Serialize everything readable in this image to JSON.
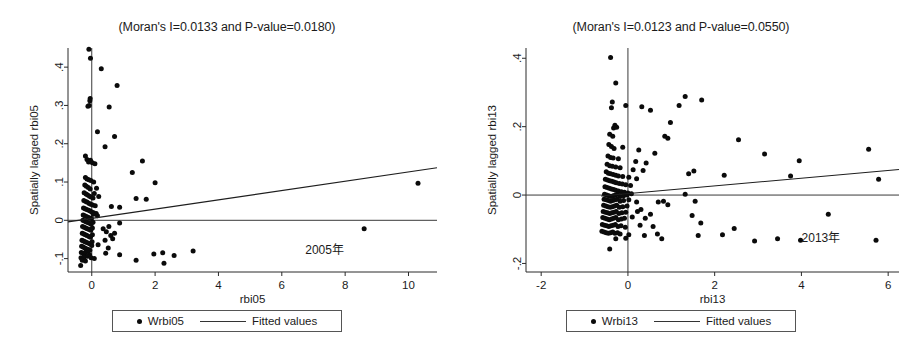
{
  "figure": {
    "width": 908,
    "height": 350,
    "background": "#ffffff",
    "ink_color": "#0b0b0b"
  },
  "chart_data": [
    {
      "id": "moran-2005",
      "type": "scatter",
      "title": "(Moran's I=0.0133 and P-value=0.0180)",
      "xlabel": "rbi05",
      "ylabel": "Spatially lagged rbi05",
      "annotation": "2005年",
      "morans_i": 0.0133,
      "p_value": 0.018,
      "xlim": [
        -0.75,
        10.9
      ],
      "ylim": [
        -0.135,
        0.45
      ],
      "xticks": [
        0,
        2,
        4,
        6,
        8,
        10
      ],
      "xtick_labels": [
        "0",
        "2",
        "4",
        "6",
        "8",
        "10"
      ],
      "yticks": [
        -0.1,
        0,
        0.1,
        0.2,
        0.3,
        0.4
      ],
      "ytick_labels": [
        "-.1",
        "0",
        ".1",
        ".2",
        ".3",
        ".4"
      ],
      "grid": false,
      "legend": {
        "position": "below",
        "entries": [
          {
            "label": "Wrbi05",
            "marker": "dot"
          },
          {
            "label": "Fitted values",
            "marker": "line"
          }
        ]
      },
      "fit_line": {
        "x0": -0.75,
        "y0": -0.0042,
        "x1": 10.9,
        "y1": 0.1372
      },
      "reference_lines": {
        "vertical_x": 0.0,
        "horizontal_y": 0.0
      },
      "points": [
        [
          -0.09,
          0.447
        ],
        [
          -0.04,
          0.423
        ],
        [
          0.3,
          0.396
        ],
        [
          0.8,
          0.352
        ],
        [
          -0.05,
          0.318
        ],
        [
          -0.06,
          0.312
        ],
        [
          -0.08,
          0.3
        ],
        [
          -0.12,
          0.298
        ],
        [
          0.55,
          0.296
        ],
        [
          0.18,
          0.231
        ],
        [
          0.72,
          0.219
        ],
        [
          0.42,
          0.192
        ],
        [
          -0.2,
          0.168
        ],
        [
          -0.15,
          0.159
        ],
        [
          -0.04,
          0.157
        ],
        [
          -0.1,
          0.152
        ],
        [
          0.02,
          0.15
        ],
        [
          0.1,
          0.148
        ],
        [
          1.6,
          0.155
        ],
        [
          1.28,
          0.125
        ],
        [
          -0.2,
          0.112
        ],
        [
          -0.15,
          0.108
        ],
        [
          -0.09,
          0.106
        ],
        [
          -0.03,
          0.104
        ],
        [
          0.06,
          0.1
        ],
        [
          2.0,
          0.098
        ],
        [
          10.3,
          0.097
        ],
        [
          -0.22,
          0.092
        ],
        [
          -0.17,
          0.089
        ],
        [
          -0.11,
          0.086
        ],
        [
          -0.05,
          0.082
        ],
        [
          0.15,
          0.084
        ],
        [
          0.08,
          0.07
        ],
        [
          -0.24,
          0.072
        ],
        [
          -0.18,
          0.069
        ],
        [
          -0.13,
          0.066
        ],
        [
          -0.07,
          0.063
        ],
        [
          -0.02,
          0.061
        ],
        [
          0.04,
          0.058
        ],
        [
          1.4,
          0.057
        ],
        [
          1.72,
          0.055
        ],
        [
          0.22,
          0.062
        ],
        [
          -0.25,
          0.052
        ],
        [
          -0.19,
          0.049
        ],
        [
          -0.14,
          0.047
        ],
        [
          -0.08,
          0.044
        ],
        [
          -0.03,
          0.042
        ],
        [
          0.03,
          0.04
        ],
        [
          0.11,
          0.038
        ],
        [
          0.62,
          0.036
        ],
        [
          0.88,
          0.034
        ],
        [
          -0.26,
          0.032
        ],
        [
          -0.21,
          0.03
        ],
        [
          -0.16,
          0.028
        ],
        [
          -0.1,
          0.026
        ],
        [
          -0.05,
          0.024
        ],
        [
          0.0,
          0.022
        ],
        [
          0.06,
          0.02
        ],
        [
          0.14,
          0.018
        ],
        [
          -0.27,
          0.014
        ],
        [
          -0.22,
          0.012
        ],
        [
          -0.17,
          0.01
        ],
        [
          -0.12,
          0.008
        ],
        [
          -0.06,
          0.006
        ],
        [
          -0.01,
          0.005
        ],
        [
          0.05,
          0.016
        ],
        [
          0.18,
          0.012
        ],
        [
          -0.28,
          0.0
        ],
        [
          -0.23,
          -0.002
        ],
        [
          -0.18,
          -0.004
        ],
        [
          -0.13,
          -0.006
        ],
        [
          -0.07,
          -0.008
        ],
        [
          -0.02,
          -0.01
        ],
        [
          0.04,
          -0.005
        ],
        [
          0.88,
          -0.007
        ],
        [
          -0.29,
          -0.016
        ],
        [
          -0.24,
          -0.018
        ],
        [
          -0.19,
          -0.02
        ],
        [
          -0.14,
          -0.022
        ],
        [
          -0.08,
          -0.024
        ],
        [
          -0.03,
          -0.026
        ],
        [
          0.02,
          -0.02
        ],
        [
          0.36,
          -0.022
        ],
        [
          0.46,
          -0.03
        ],
        [
          0.54,
          -0.016
        ],
        [
          8.6,
          -0.022
        ],
        [
          -0.3,
          -0.034
        ],
        [
          -0.25,
          -0.036
        ],
        [
          -0.2,
          -0.038
        ],
        [
          -0.15,
          -0.04
        ],
        [
          -0.09,
          -0.042
        ],
        [
          -0.04,
          -0.044
        ],
        [
          0.02,
          -0.038
        ],
        [
          0.6,
          -0.04
        ],
        [
          0.66,
          -0.048
        ],
        [
          0.72,
          -0.034
        ],
        [
          -0.31,
          -0.052
        ],
        [
          -0.26,
          -0.054
        ],
        [
          -0.21,
          -0.056
        ],
        [
          -0.16,
          -0.058
        ],
        [
          -0.1,
          -0.06
        ],
        [
          -0.05,
          -0.062
        ],
        [
          0.01,
          -0.056
        ],
        [
          0.42,
          -0.052
        ],
        [
          -0.32,
          -0.068
        ],
        [
          -0.27,
          -0.07
        ],
        [
          -0.22,
          -0.072
        ],
        [
          -0.17,
          -0.074
        ],
        [
          -0.11,
          -0.076
        ],
        [
          -0.06,
          -0.078
        ],
        [
          0.0,
          -0.066
        ],
        [
          0.2,
          -0.064
        ],
        [
          0.52,
          -0.072
        ],
        [
          -0.33,
          -0.084
        ],
        [
          -0.28,
          -0.086
        ],
        [
          -0.23,
          -0.088
        ],
        [
          -0.18,
          -0.082
        ],
        [
          -0.12,
          -0.08
        ],
        [
          -0.07,
          -0.09
        ],
        [
          0.44,
          -0.086
        ],
        [
          0.88,
          -0.09
        ],
        [
          1.96,
          -0.088
        ],
        [
          2.24,
          -0.085
        ],
        [
          2.6,
          -0.092
        ],
        [
          3.2,
          -0.08
        ],
        [
          -0.34,
          -0.098
        ],
        [
          -0.29,
          -0.1
        ],
        [
          -0.24,
          -0.096
        ],
        [
          -0.13,
          -0.094
        ],
        [
          -0.02,
          -0.098
        ],
        [
          0.08,
          -0.1
        ],
        [
          -0.3,
          -0.104
        ],
        [
          -0.2,
          -0.106
        ],
        [
          1.4,
          -0.104
        ],
        [
          2.28,
          -0.112
        ],
        [
          -0.35,
          -0.118
        ]
      ]
    },
    {
      "id": "moran-2013",
      "type": "scatter",
      "title": "(Moran's I=0.0123 and P-value=0.0550)",
      "xlabel": "rbi13",
      "ylabel": "Spatially lagged rbi13",
      "annotation": "2013年",
      "morans_i": 0.0123,
      "p_value": 0.055,
      "xlim": [
        -2.35,
        6.25
      ],
      "ylim": [
        -0.225,
        0.43
      ],
      "xticks": [
        -2,
        0,
        2,
        4,
        6
      ],
      "xtick_labels": [
        "-2",
        "0",
        "2",
        "4",
        "6"
      ],
      "yticks": [
        -0.2,
        0,
        0.2,
        0.4
      ],
      "ytick_labels": [
        "-.2",
        "0",
        ".2",
        ".4"
      ],
      "grid": false,
      "legend": {
        "position": "below",
        "entries": [
          {
            "label": "Wrbi13",
            "marker": "dot"
          },
          {
            "label": "Fitted values",
            "marker": "line"
          }
        ]
      },
      "fit_line": {
        "x0": -0.62,
        "y0": -0.0028,
        "x1": 6.25,
        "y1": 0.0745
      },
      "reference_lines": {
        "vertical_x": 0.0,
        "horizontal_y": 0.0
      },
      "points": [
        [
          -0.4,
          0.402
        ],
        [
          -0.28,
          0.328
        ],
        [
          -0.36,
          0.272
        ],
        [
          -0.05,
          0.262
        ],
        [
          -0.38,
          0.255
        ],
        [
          0.32,
          0.258
        ],
        [
          0.52,
          0.248
        ],
        [
          1.32,
          0.288
        ],
        [
          1.7,
          0.278
        ],
        [
          1.18,
          0.262
        ],
        [
          0.98,
          0.212
        ],
        [
          -0.33,
          0.196
        ],
        [
          -0.3,
          0.204
        ],
        [
          -0.26,
          0.198
        ],
        [
          -0.42,
          0.178
        ],
        [
          -0.35,
          0.172
        ],
        [
          0.85,
          0.172
        ],
        [
          0.92,
          0.166
        ],
        [
          2.55,
          0.162
        ],
        [
          5.55,
          0.134
        ],
        [
          3.15,
          0.12
        ],
        [
          3.95,
          0.1
        ],
        [
          -0.44,
          0.148
        ],
        [
          -0.38,
          0.142
        ],
        [
          -0.32,
          0.136
        ],
        [
          -0.12,
          0.14
        ],
        [
          0.25,
          0.132
        ],
        [
          0.62,
          0.122
        ],
        [
          -0.46,
          0.114
        ],
        [
          -0.4,
          0.11
        ],
        [
          -0.34,
          0.108
        ],
        [
          -0.22,
          0.106
        ],
        [
          0.18,
          0.098
        ],
        [
          0.42,
          0.094
        ],
        [
          -0.48,
          0.09
        ],
        [
          -0.42,
          0.086
        ],
        [
          -0.36,
          0.084
        ],
        [
          -0.28,
          0.082
        ],
        [
          -0.18,
          0.08
        ],
        [
          0.12,
          0.074
        ],
        [
          0.35,
          0.072
        ],
        [
          1.52,
          0.07
        ],
        [
          2.22,
          0.058
        ],
        [
          3.75,
          0.056
        ],
        [
          5.78,
          0.046
        ],
        [
          -0.5,
          0.068
        ],
        [
          -0.45,
          0.064
        ],
        [
          -0.4,
          0.062
        ],
        [
          -0.34,
          0.06
        ],
        [
          -0.28,
          0.058
        ],
        [
          -0.22,
          0.056
        ],
        [
          -0.12,
          0.054
        ],
        [
          0.02,
          0.052
        ],
        [
          0.2,
          0.048
        ],
        [
          1.4,
          0.062
        ],
        [
          -0.52,
          0.046
        ],
        [
          -0.47,
          0.044
        ],
        [
          -0.42,
          0.042
        ],
        [
          -0.37,
          0.04
        ],
        [
          -0.32,
          0.038
        ],
        [
          -0.27,
          0.036
        ],
        [
          -0.2,
          0.034
        ],
        [
          -0.13,
          0.032
        ],
        [
          -0.05,
          0.03
        ],
        [
          0.06,
          0.028
        ],
        [
          -0.53,
          0.024
        ],
        [
          -0.48,
          0.022
        ],
        [
          -0.43,
          0.02
        ],
        [
          -0.38,
          0.018
        ],
        [
          -0.33,
          0.016
        ],
        [
          -0.28,
          0.014
        ],
        [
          -0.22,
          0.012
        ],
        [
          -0.15,
          0.01
        ],
        [
          -0.08,
          0.008
        ],
        [
          0.0,
          0.006
        ],
        [
          0.08,
          0.004
        ],
        [
          -0.54,
          0.002
        ],
        [
          -0.49,
          0.0
        ],
        [
          -0.44,
          -0.002
        ],
        [
          -0.39,
          -0.004
        ],
        [
          -0.34,
          -0.002
        ],
        [
          -0.29,
          0.0
        ],
        [
          -0.24,
          0.002
        ],
        [
          -0.18,
          -0.004
        ],
        [
          -0.1,
          -0.002
        ],
        [
          -0.02,
          0.0
        ],
        [
          1.32,
          0.002
        ],
        [
          -0.55,
          -0.012
        ],
        [
          -0.5,
          -0.014
        ],
        [
          -0.45,
          -0.016
        ],
        [
          -0.4,
          -0.018
        ],
        [
          -0.35,
          -0.016
        ],
        [
          -0.3,
          -0.014
        ],
        [
          -0.25,
          -0.012
        ],
        [
          -0.18,
          -0.018
        ],
        [
          -0.1,
          -0.016
        ],
        [
          0.02,
          -0.014
        ],
        [
          0.2,
          -0.02
        ],
        [
          0.7,
          -0.02
        ],
        [
          0.82,
          -0.018
        ],
        [
          0.92,
          -0.028
        ],
        [
          1.55,
          -0.018
        ],
        [
          -0.56,
          -0.03
        ],
        [
          -0.51,
          -0.032
        ],
        [
          -0.46,
          -0.034
        ],
        [
          -0.41,
          -0.036
        ],
        [
          -0.36,
          -0.034
        ],
        [
          -0.31,
          -0.032
        ],
        [
          -0.26,
          -0.03
        ],
        [
          -0.2,
          -0.036
        ],
        [
          -0.12,
          -0.034
        ],
        [
          -0.02,
          -0.032
        ],
        [
          0.3,
          -0.042
        ],
        [
          -0.57,
          -0.048
        ],
        [
          -0.52,
          -0.05
        ],
        [
          -0.47,
          -0.052
        ],
        [
          -0.42,
          -0.054
        ],
        [
          -0.37,
          -0.052
        ],
        [
          -0.32,
          -0.05
        ],
        [
          -0.27,
          -0.048
        ],
        [
          -0.21,
          -0.054
        ],
        [
          -0.14,
          -0.052
        ],
        [
          -0.05,
          -0.05
        ],
        [
          0.22,
          -0.048
        ],
        [
          0.52,
          -0.056
        ],
        [
          1.48,
          -0.06
        ],
        [
          4.62,
          -0.056
        ],
        [
          -0.58,
          -0.066
        ],
        [
          -0.53,
          -0.068
        ],
        [
          -0.48,
          -0.07
        ],
        [
          -0.43,
          -0.072
        ],
        [
          -0.38,
          -0.07
        ],
        [
          -0.33,
          -0.068
        ],
        [
          -0.28,
          -0.066
        ],
        [
          -0.22,
          -0.072
        ],
        [
          -0.15,
          -0.07
        ],
        [
          -0.08,
          -0.068
        ],
        [
          0.1,
          -0.064
        ],
        [
          0.4,
          -0.068
        ],
        [
          1.68,
          -0.082
        ],
        [
          -0.59,
          -0.086
        ],
        [
          -0.54,
          -0.088
        ],
        [
          -0.49,
          -0.09
        ],
        [
          -0.44,
          -0.092
        ],
        [
          -0.39,
          -0.09
        ],
        [
          -0.34,
          -0.088
        ],
        [
          -0.29,
          -0.086
        ],
        [
          -0.23,
          -0.092
        ],
        [
          -0.16,
          -0.09
        ],
        [
          -0.06,
          -0.094
        ],
        [
          0.28,
          -0.088
        ],
        [
          0.58,
          -0.092
        ],
        [
          2.45,
          -0.098
        ],
        [
          -0.6,
          -0.106
        ],
        [
          -0.55,
          -0.108
        ],
        [
          -0.5,
          -0.11
        ],
        [
          -0.45,
          -0.112
        ],
        [
          -0.4,
          -0.11
        ],
        [
          -0.35,
          -0.108
        ],
        [
          -0.3,
          -0.112
        ],
        [
          -0.24,
          -0.11
        ],
        [
          -0.18,
          -0.114
        ],
        [
          0.02,
          -0.116
        ],
        [
          0.68,
          -0.114
        ],
        [
          -0.28,
          -0.128
        ],
        [
          -0.05,
          -0.126
        ],
        [
          0.38,
          -0.118
        ],
        [
          1.62,
          -0.118
        ],
        [
          2.18,
          -0.116
        ],
        [
          2.92,
          -0.134
        ],
        [
          3.45,
          -0.128
        ],
        [
          3.98,
          -0.132
        ],
        [
          5.72,
          -0.132
        ],
        [
          0.78,
          -0.128
        ],
        [
          -0.42,
          -0.158
        ]
      ]
    }
  ]
}
